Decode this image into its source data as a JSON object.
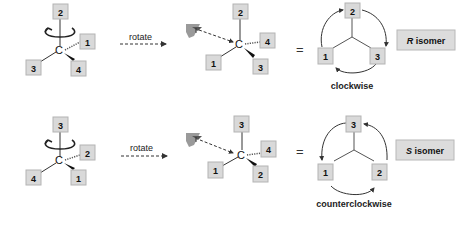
{
  "colors": {
    "box_fill": "#d9d9d9",
    "box_stroke": "#b3b3b3",
    "line": "#333333",
    "text": "#111111",
    "eye": "#8c8c8c"
  },
  "panels": [
    {
      "name": "r-configuration",
      "start_molecule": {
        "top": "2",
        "right_hashed": "1",
        "left": "3",
        "wedge": "4",
        "center": "C"
      },
      "rotate_label": "rotate",
      "rotated_molecule": {
        "top": "2",
        "right_hashed": "4",
        "left": "1",
        "wedge": "3",
        "center": "C"
      },
      "equals": "=",
      "projection": {
        "top": "2",
        "left": "1",
        "right": "3"
      },
      "direction_label": "clockwise",
      "result_label": {
        "letter": "R",
        "text": " isomer"
      }
    },
    {
      "name": "s-configuration",
      "start_molecule": {
        "top": "3",
        "right_hashed": "2",
        "left": "4",
        "wedge": "1",
        "center": "C"
      },
      "rotate_label": "rotate",
      "rotated_molecule": {
        "top": "3",
        "right_hashed": "4",
        "left": "1",
        "wedge": "2",
        "center": "C"
      },
      "equals": "=",
      "projection": {
        "top": "3",
        "left": "1",
        "right": "2"
      },
      "direction_label": "counterclockwise",
      "result_label": {
        "letter": "S",
        "text": " isomer"
      }
    }
  ]
}
